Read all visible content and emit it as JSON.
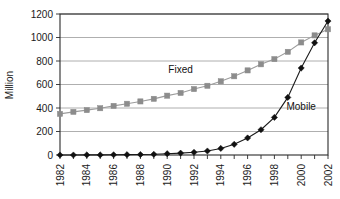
{
  "chart_data": {
    "type": "line",
    "title": "",
    "subtitle": "",
    "xlabel": "",
    "ylabel": "Million",
    "x": [
      1982,
      1983,
      1984,
      1985,
      1986,
      1987,
      1988,
      1989,
      1990,
      1991,
      1992,
      1993,
      1994,
      1995,
      1996,
      1997,
      1998,
      1999,
      2000,
      2001,
      2002
    ],
    "xtick_labels": [
      "1982",
      "1984",
      "1986",
      "1988",
      "1990",
      "1992",
      "1994",
      "1996",
      "1998",
      "2000",
      "2002"
    ],
    "xtick_values": [
      1982,
      1984,
      1986,
      1988,
      1990,
      1992,
      1994,
      1996,
      1998,
      2000,
      2002
    ],
    "xlim": [
      1982,
      2002
    ],
    "ytick_labels": [
      "0",
      "200",
      "400",
      "600",
      "800",
      "1000",
      "1200"
    ],
    "ytick_values": [
      0,
      200,
      400,
      600,
      800,
      1000,
      1200
    ],
    "ylim": [
      0,
      1200
    ],
    "grid": "horizontal",
    "legend_position": "inline-annotation",
    "series": [
      {
        "name": "Fixed",
        "marker": "square",
        "color": "#8c8c8c",
        "line_color": "#9c9c9c",
        "label_x": 1991,
        "label_y": 700,
        "values": [
          350,
          367,
          382,
          398,
          418,
          436,
          456,
          478,
          505,
          528,
          561,
          589,
          627,
          670,
          720,
          772,
          816,
          878,
          958,
          1018,
          1070
        ]
      },
      {
        "name": "Mobile",
        "marker": "diamond",
        "color": "#111111",
        "line_color": "#1a1a1a",
        "label_x": 2000,
        "label_y": 380,
        "values": [
          0,
          0,
          1,
          1,
          2,
          3,
          4,
          6,
          11,
          16,
          23,
          34,
          56,
          91,
          145,
          215,
          320,
          490,
          740,
          955,
          1140
        ]
      }
    ]
  },
  "axis": {
    "y_title": "Million"
  }
}
